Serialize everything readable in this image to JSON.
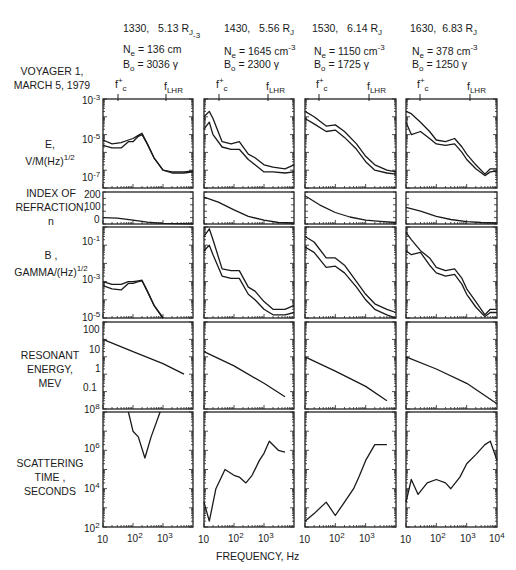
{
  "figure": {
    "mission_label": [
      "VOYAGER 1,",
      "MARCH 5, 1979"
    ],
    "xlabel": "FREQUENCY,  Hz",
    "columns": [
      {
        "time": "1330,",
        "radius": "5.13 R",
        "radius_sub": "J",
        "ne_label": "N",
        "ne_sub": "e",
        "ne_value": "=  136 cm",
        "ne_sup": "-3",
        "bo_label": "B",
        "bo_sub": "o",
        "bo_value": "=  3036 γ"
      },
      {
        "time": "1430,",
        "radius": "5.56 R",
        "radius_sub": "J",
        "ne_label": "N",
        "ne_sub": "e",
        "ne_value": "=  1645 cm",
        "ne_sup": "-3",
        "bo_label": "B",
        "bo_sub": "o",
        "bo_value": "=  2300 γ"
      },
      {
        "time": "1530,",
        "radius": "6.14 R",
        "radius_sub": "J",
        "ne_label": "N",
        "ne_sub": "e",
        "ne_value": "=  1150 cm",
        "ne_sup": "-3",
        "bo_label": "B",
        "bo_sub": "o",
        "bo_value": "=  1725 γ"
      },
      {
        "time": "1630,",
        "radius": "6.83 R",
        "radius_sub": "J",
        "ne_label": "N",
        "ne_sub": "e",
        "ne_value": "=  378 cm",
        "ne_sup": "-3",
        "bo_label": "B",
        "bo_sub": "o",
        "bo_value": "=  1250 γ"
      }
    ],
    "markers": {
      "fc": "f",
      "fc_sup": "+",
      "fc_sub": "c",
      "flhr": "f",
      "flhr_sub": "LHR"
    },
    "row_labels": {
      "e": [
        "E,",
        "V/M(Hz)",
        "1/2"
      ],
      "n": [
        "INDEX OF",
        "REFRACTION,",
        "n"
      ],
      "b": [
        "B ,",
        "GAMMA/(Hz)",
        "1/2"
      ],
      "energy": [
        "RESONANT",
        "ENERGY,",
        "MEV"
      ],
      "time": [
        "SCATTERING",
        "TIME ,",
        "SECONDS"
      ]
    },
    "y_ticks": {
      "e": [
        "10",
        "-3",
        "10",
        "-5",
        "10",
        "-7"
      ],
      "n": [
        "200",
        "100",
        "0"
      ],
      "b": [
        "10",
        "-1",
        "10",
        "-3",
        "10",
        "-5"
      ],
      "energy": [
        "100",
        "10",
        "1",
        "0.1"
      ],
      "time": [
        "10",
        "8",
        "10",
        "6",
        "10",
        "4",
        "10",
        "2"
      ]
    },
    "x_ticks": [
      "10",
      "10",
      "2",
      "10",
      "3",
      "10",
      "4"
    ]
  },
  "chart_data": [
    {
      "type": "line",
      "title": "E, V/M(Hz)^1/2 (upper & lower envelopes)",
      "xlabel": "FREQUENCY, Hz",
      "ylabel": "E, V/M(Hz)^1/2",
      "xscale": "log",
      "yscale": "log",
      "xlim": [
        10,
        10000
      ],
      "ylim": [
        1e-08,
        0.001
      ],
      "panels": [
        {
          "name": "1330",
          "x": [
            10,
            20,
            40,
            70,
            100,
            150,
            200,
            300,
            500,
            1000,
            2000,
            5000,
            10000
          ],
          "upper": [
            5e-06,
            3e-06,
            3.5e-06,
            5e-06,
            6e-06,
            9e-06,
            1.2e-05,
            3e-06,
            5e-07,
            1e-07,
            8e-08,
            8e-08,
            9e-08
          ],
          "lower": [
            2.5e-06,
            1.8e-06,
            1.8e-06,
            4e-06,
            4e-06,
            8e-06,
            1e-05,
            3e-06,
            5e-07,
            1e-07,
            7e-08,
            7e-08,
            8e-08
          ]
        },
        {
          "name": "1430",
          "x": [
            10,
            15,
            20,
            40,
            80,
            150,
            300,
            500,
            1000,
            2000,
            5000,
            10000
          ],
          "upper": [
            0.0001,
            0.0002,
            8e-05,
            4e-06,
            3e-06,
            4e-06,
            8e-07,
            5e-07,
            2e-07,
            1.5e-07,
            1.2e-07,
            2e-07
          ],
          "lower": [
            2e-05,
            5e-05,
            1e-05,
            2e-06,
            1.5e-06,
            1.5e-06,
            4e-07,
            2e-07,
            8e-08,
            8e-08,
            7e-08,
            8e-08
          ]
        },
        {
          "name": "1530",
          "x": [
            10,
            20,
            50,
            100,
            200,
            500,
            1000,
            2000,
            5000,
            10000
          ],
          "upper": [
            0.0002,
            0.0001,
            3e-05,
            3.5e-05,
            1.5e-05,
            3e-06,
            6e-07,
            2e-07,
            1e-07,
            8e-08
          ],
          "lower": [
            8e-05,
            4e-05,
            1.5e-05,
            1.8e-05,
            7e-06,
            1.5e-06,
            3e-07,
            1e-07,
            7e-08,
            6e-08
          ]
        },
        {
          "name": "1630",
          "x": [
            10,
            15,
            30,
            60,
            100,
            200,
            400,
            700,
            1000,
            2000,
            4000,
            6000,
            10000
          ],
          "upper": [
            0.0002,
            0.00015,
            5e-05,
            1.5e-05,
            5e-06,
            4e-06,
            6e-06,
            2e-06,
            8e-07,
            2e-07,
            6e-08,
            1.2e-07,
            1.2e-07
          ],
          "lower": [
            5e-05,
            1e-05,
            1.5e-05,
            6e-06,
            3e-06,
            2.5e-06,
            3e-06,
            1e-06,
            4e-07,
            1.2e-07,
            5e-08,
            8e-08,
            9e-08
          ]
        }
      ]
    },
    {
      "type": "line",
      "title": "INDEX OF REFRACTION, n",
      "xscale": "log",
      "yscale": "linear",
      "xlim": [
        10,
        10000
      ],
      "ylim": [
        0,
        250
      ],
      "panels": [
        {
          "name": "1330",
          "x": [
            10,
            30,
            100,
            300,
            1000,
            3000,
            10000
          ],
          "y": [
            50,
            45,
            30,
            15,
            5,
            2,
            1
          ]
        },
        {
          "name": "1430",
          "x": [
            10,
            30,
            100,
            300,
            1000,
            3000,
            10000
          ],
          "y": [
            210,
            170,
            110,
            60,
            30,
            12,
            8
          ]
        },
        {
          "name": "1530",
          "x": [
            10,
            30,
            100,
            300,
            1000,
            3000,
            10000
          ],
          "y": [
            220,
            150,
            90,
            55,
            30,
            20,
            12
          ]
        },
        {
          "name": "1630",
          "x": [
            10,
            30,
            100,
            300,
            1000,
            3000,
            10000
          ],
          "y": [
            130,
            100,
            60,
            35,
            18,
            12,
            8
          ]
        }
      ]
    },
    {
      "type": "line",
      "title": "B, GAMMA/(Hz)^1/2 (upper & lower envelopes)",
      "xscale": "log",
      "yscale": "log",
      "xlim": [
        10,
        10000
      ],
      "ylim": [
        1e-05,
        1
      ],
      "panels": [
        {
          "name": "1330",
          "x": [
            10,
            20,
            40,
            70,
            100,
            150,
            200,
            300,
            500,
            1000
          ],
          "upper": [
            0.001,
            0.0007,
            0.0007,
            0.001,
            0.001,
            0.0011,
            0.0012,
            0.0003,
            5e-05,
            1e-05
          ],
          "lower": [
            0.0006,
            0.0004,
            0.00035,
            0.0008,
            0.0008,
            0.001,
            0.0011,
            0.0003,
            5e-05,
            1e-05
          ]
        },
        {
          "name": "1430",
          "x": [
            10,
            15,
            20,
            40,
            80,
            150,
            300,
            500,
            1000,
            2000,
            5000,
            10000
          ],
          "upper": [
            0.3,
            0.8,
            0.2,
            0.005,
            0.004,
            0.004,
            0.0005,
            0.0003,
            8e-05,
            3e-05,
            3e-05,
            5e-05
          ],
          "lower": [
            0.05,
            0.1,
            0.03,
            0.002,
            0.0015,
            0.0015,
            0.0002,
            0.0001,
            3e-05,
            1.5e-05,
            1.5e-05,
            2e-05
          ]
        },
        {
          "name": "1530",
          "x": [
            10,
            20,
            50,
            100,
            200,
            500,
            1000,
            2000,
            5000,
            10000
          ],
          "upper": [
            0.3,
            0.15,
            0.02,
            0.02,
            0.008,
            0.001,
            0.0002,
            6e-05,
            3e-05,
            2e-05
          ],
          "lower": [
            0.08,
            0.04,
            0.006,
            0.007,
            0.003,
            0.0005,
            0.0001,
            3e-05,
            1.5e-05,
            1e-05
          ]
        },
        {
          "name": "1630",
          "x": [
            10,
            15,
            30,
            60,
            100,
            200,
            400,
            700,
            1000,
            2000,
            4000,
            6000,
            10000
          ],
          "upper": [
            0.5,
            0.2,
            0.05,
            0.02,
            0.006,
            0.004,
            0.005,
            0.0015,
            0.0004,
            8e-05,
            1.5e-05,
            3e-05,
            3e-05
          ],
          "lower": [
            0.05,
            0.03,
            0.04,
            0.008,
            0.003,
            0.002,
            0.0025,
            0.0007,
            0.0002,
            4e-05,
            1.2e-05,
            2e-05,
            2e-05
          ]
        }
      ]
    },
    {
      "type": "line",
      "title": "RESONANT ENERGY, MEV",
      "xscale": "log",
      "yscale": "log",
      "xlim": [
        10,
        10000
      ],
      "ylim": [
        0.01,
        1000
      ],
      "panels": [
        {
          "name": "1330",
          "x": [
            10,
            100,
            1000,
            5000
          ],
          "y": [
            100,
            20,
            4,
            1
          ]
        },
        {
          "name": "1430",
          "x": [
            10,
            100,
            1000,
            5000
          ],
          "y": [
            20,
            3,
            0.3,
            0.05
          ]
        },
        {
          "name": "1530",
          "x": [
            10,
            100,
            1000,
            5000
          ],
          "y": [
            10,
            1.5,
            0.2,
            0.03
          ]
        },
        {
          "name": "1630",
          "x": [
            10,
            100,
            1000,
            10000
          ],
          "y": [
            10,
            2,
            0.3,
            0.02
          ]
        }
      ]
    },
    {
      "type": "line",
      "title": "SCATTERING TIME, SECONDS",
      "xscale": "log",
      "yscale": "log",
      "xlim": [
        10,
        10000
      ],
      "ylim": [
        100,
        100000000.0
      ],
      "panels": [
        {
          "name": "1330",
          "x": [
            70,
            100,
            150,
            250,
            400,
            800
          ],
          "y": [
            100000000.0,
            10000000.0,
            5000000.0,
            400000.0,
            5000000.0,
            100000000.0
          ]
        },
        {
          "name": "1430",
          "x": [
            10,
            15,
            25,
            50,
            100,
            150,
            250,
            400,
            700,
            1000,
            1500,
            3000,
            5000
          ],
          "y": [
            2000.0,
            200,
            10000.0,
            100000.0,
            50000.0,
            40000.0,
            20000.0,
            50000.0,
            300000.0,
            700000.0,
            3000000.0,
            1000000.0,
            800000.0
          ]
        },
        {
          "name": "1530",
          "x": [
            10,
            20,
            50,
            100,
            200,
            400,
            600,
            1000,
            2000,
            5000
          ],
          "y": [
            200,
            500,
            2000.0,
            400,
            2000.0,
            10000.0,
            40000.0,
            300000.0,
            2000000.0,
            2000000.0
          ]
        },
        {
          "name": "1630",
          "x": [
            10,
            15,
            25,
            50,
            100,
            200,
            300,
            600,
            1000,
            2000,
            4000,
            6000,
            10000
          ],
          "y": [
            2000.0,
            30000.0,
            5000.0,
            20000.0,
            30000.0,
            20000.0,
            10000.0,
            40000.0,
            200000.0,
            600000.0,
            2000000.0,
            3000000.0,
            300000.0
          ]
        }
      ]
    }
  ]
}
